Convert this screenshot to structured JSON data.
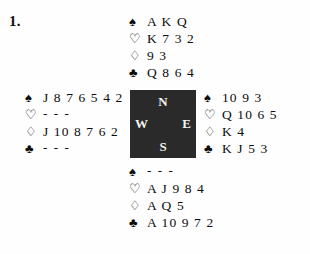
{
  "figure": {
    "problem_number": "1.",
    "background_color": "#fefefe",
    "ink_color": "#0c0c0c",
    "compass_box_color": "#2a2a2a",
    "compass_text_color": "#f4f4f4"
  },
  "suits": {
    "spade": {
      "glyph": "♠",
      "name": "spade-symbol",
      "filled": true
    },
    "heart": {
      "glyph": "♡",
      "name": "heart-symbol",
      "filled": false
    },
    "diamond": {
      "glyph": "♢",
      "name": "diamond-symbol",
      "filled": false
    },
    "club": {
      "glyph": "♣",
      "name": "club-symbol",
      "filled": true
    }
  },
  "compass": {
    "north": "N",
    "west": "W",
    "east": "E",
    "south": "S"
  },
  "hands": {
    "north": {
      "position": "North",
      "spades": "A K Q",
      "hearts": "K 7 3 2",
      "diamonds": "9 3",
      "clubs": "Q 8 6 4"
    },
    "west": {
      "position": "West",
      "spades": "J 8 7 6 5 4 2",
      "hearts": "- - -",
      "diamonds": "J 10 8 7 6 2",
      "clubs": "- - -"
    },
    "east": {
      "position": "East",
      "spades": "10 9 3",
      "hearts": "Q 10 6 5",
      "diamonds": "K 4",
      "clubs": "K J 5 3"
    },
    "south": {
      "position": "South",
      "spades": "- - -",
      "hearts": "A J 9 8 4",
      "diamonds": "A Q 5",
      "clubs": "A 10 9 7 2"
    }
  }
}
